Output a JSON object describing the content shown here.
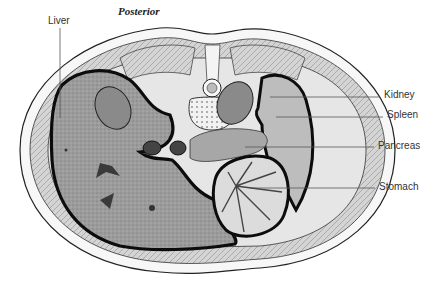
{
  "figure": {
    "title": "Posterior",
    "labels": {
      "liver": "Liver",
      "kidney": "Kidney",
      "spleen": "Spleen",
      "pancreas": "Pancreas",
      "stomach": "Stomach"
    },
    "colors": {
      "organ_fill": "#9a9a9a",
      "outline": "#111111",
      "muscle_fill": "#cfcfcf",
      "background": "#ffffff",
      "leader_line": "#555555"
    }
  }
}
